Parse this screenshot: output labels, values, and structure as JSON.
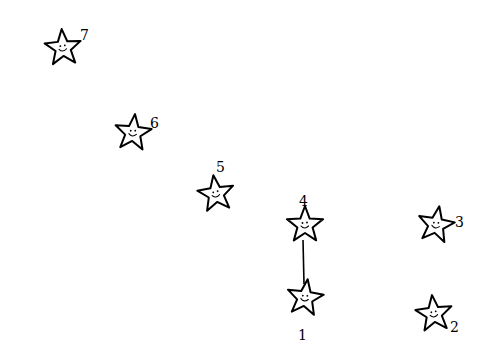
{
  "puzzle": {
    "type": "connect-the-dots",
    "background": "#ffffff",
    "ink_color": "#000000",
    "dots": [
      {
        "number": "1",
        "cx": 305,
        "cy": 298,
        "rot": 8,
        "lx": 298,
        "ly": 340
      },
      {
        "number": "2",
        "cx": 434,
        "cy": 314,
        "rot": -6,
        "lx": 450,
        "ly": 332
      },
      {
        "number": "3",
        "cx": 436,
        "cy": 225,
        "rot": 10,
        "lx": 455,
        "ly": 227
      },
      {
        "number": "4",
        "cx": 305,
        "cy": 225,
        "rot": 0,
        "lx": 299,
        "ly": 206
      },
      {
        "number": "5",
        "cx": 216,
        "cy": 194,
        "rot": -8,
        "lx": 216,
        "ly": 172
      },
      {
        "number": "6",
        "cx": 133,
        "cy": 133,
        "rot": 6,
        "lx": 150,
        "ly": 128
      },
      {
        "number": "7",
        "cx": 63,
        "cy": 48,
        "rot": -4,
        "lx": 80,
        "ly": 40
      }
    ],
    "connected_segments": [
      {
        "from": "4",
        "to": "1",
        "x1": 303,
        "y1": 240,
        "x2": 304,
        "y2": 284
      }
    ]
  }
}
